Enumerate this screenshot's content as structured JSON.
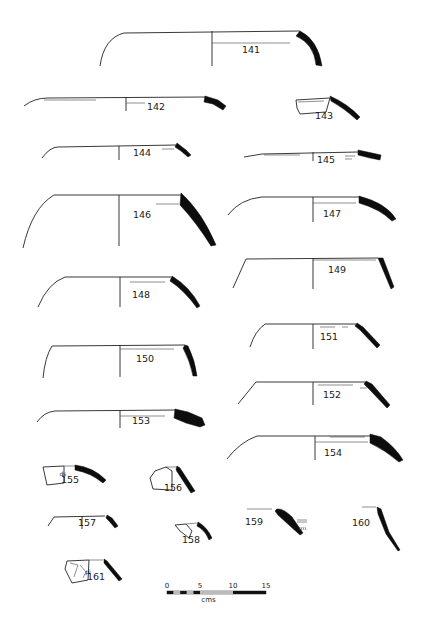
{
  "plate": {
    "background": "#ffffff",
    "ink_color": "#0d0d0d",
    "profiles": [
      {
        "id": "141",
        "label": "141",
        "label_xy": [
          251,
          53
        ],
        "outline": "M100,66 Q104,38 124,33 L300,31",
        "axis": "M212,31 L212,66",
        "inner": "M212,43 L290,43",
        "section": "M300,31 Q318,40 322,66 L316,65 Q314,44 296,36 Z"
      },
      {
        "id": "142",
        "label": "142",
        "label_xy": [
          156,
          110
        ],
        "outline": "M24,106 Q34,98 48,98 L205,97",
        "axis": "M126,97 L126,111",
        "inner": "M126,103 L145,103 M44,100 L96,100",
        "section": "M205,96 L218,100 L226,106 L223,110 L213,104 L204,102 Z"
      },
      {
        "id": "143",
        "label": "143",
        "label_xy": [
          324,
          119
        ],
        "outline": "M296,100 L330,98 L326,112 L300,114 L297,108 Z",
        "axis": "",
        "inner": "M298,102 L324,101",
        "section": "M330,96 Q348,104 360,117 L357,120 Q344,108 331,101 Z"
      },
      {
        "id": "144",
        "label": "144",
        "label_xy": [
          142,
          156
        ],
        "outline": "M42,158 Q50,147 58,147 L176,145",
        "axis": "M119,146 L119,160",
        "inner": "M162,149 L174,149",
        "section": "M177,143 L186,150 L191,155 L188,157 L181,151 L175,147 Z"
      },
      {
        "id": "145",
        "label": "145",
        "label_xy": [
          326,
          163
        ],
        "outline": "M244,157 L262,154 L358,152",
        "axis": "M313,152 L313,161",
        "inner": "M264,155 L300,155 M345,156 L355,156 M345,159 L352,159",
        "section": "M358,150 L372,153 L381,155 L380,160 L370,158 L358,155 Z"
      },
      {
        "id": "146",
        "label": "146",
        "label_xy": [
          142,
          218
        ],
        "outline": "M23,248 Q32,208 54,195 L181,195",
        "axis": "M119,195 L119,246",
        "inner": "M156,204 L179,204",
        "section": "M181,193 Q202,212 216,245 L211,246 Q196,222 180,205 Z"
      },
      {
        "id": "147",
        "label": "147",
        "label_xy": [
          332,
          217
        ],
        "outline": "M228,215 Q240,199 262,197 L359,197",
        "axis": "M313,197 L313,222",
        "inner": "M313,203 L356,203",
        "section": "M359,196 Q386,203 396,219 L392,221 Q380,209 359,203 Z"
      },
      {
        "id": "148",
        "label": "148",
        "label_xy": [
          141,
          298
        ],
        "outline": "M38,307 Q48,283 65,277 L171,277",
        "axis": "M120,277 L120,307",
        "inner": "M130,282 L165,282",
        "section": "M172,276 Q190,287 200,306 L197,308 Q184,290 170,281 Z"
      },
      {
        "id": "149",
        "label": "149",
        "label_xy": [
          337,
          273
        ],
        "outline": "M233,288 L246,259 L378,258",
        "axis": "M313,258 L313,289",
        "inner": "M313,260 L376,260",
        "section": "M378,258 L383,258 L394,287 L391,289 Z"
      },
      {
        "id": "150",
        "label": "150",
        "label_xy": [
          145,
          362
        ],
        "outline": "M43,378 Q45,357 52,346 L185,345",
        "axis": "M120,345 L120,377",
        "inner": "M120,349 L174,349",
        "section": "M185,345 L188,346 Q195,360 197,376 L193,376 Q190,361 183,348 Z"
      },
      {
        "id": "151",
        "label": "151",
        "label_xy": [
          329,
          340
        ],
        "outline": "M250,347 Q255,331 265,324 L356,324",
        "axis": "M313,324 L313,349",
        "inner": "M320,327 L335,327 M342,327 L348,327",
        "section": "M357,323 L363,327 L380,345 L377,348 L360,330 L355,326 Z"
      },
      {
        "id": "152",
        "label": "152",
        "label_xy": [
          332,
          398
        ],
        "outline": "M238,404 L256,382 L365,382",
        "axis": "M313,382 L313,405",
        "inner": "M318,385 L353,385 M360,388 L367,388",
        "section": "M366,381 L372,384 L390,405 L387,408 L369,389 L364,384 Z"
      },
      {
        "id": "153",
        "label": "153",
        "label_xy": [
          141,
          424
        ],
        "outline": "M37,422 Q44,412 55,411 L175,410",
        "axis": "M120,410 L120,428",
        "inner": "M120,416 L165,416",
        "section": "M175,409 L188,412 L202,418 L205,425 L200,427 L186,423 L174,418 Z"
      },
      {
        "id": "154",
        "label": "154",
        "label_xy": [
          333,
          456
        ],
        "outline": "M227,459 Q240,442 257,436 L370,436",
        "axis": "M315,436 L315,460",
        "inner": "M330,437 L365,437 M315,442 L368,442",
        "section": "M370,434 L381,437 Q396,448 403,460 L399,462 Q385,450 370,443 Z"
      }
    ],
    "fragments": [
      {
        "id": "155",
        "label": "155",
        "label_xy": [
          70,
          483
        ],
        "note": "ds",
        "note_xy": [
          63,
          476
        ],
        "outline": "M43,467 L64,466 L64,483 L47,485 Z",
        "extra": "M64,466 L75,466",
        "section": "M75,465 Q93,467 106,480 L103,483 Q91,473 75,470 Z"
      },
      {
        "id": "156",
        "label": "156",
        "label_xy": [
          173,
          491
        ],
        "outline": "M155,471 L166,467 L172,471 L172,490 L153,489 L150,478 Z",
        "extra": "M166,467 L177,467",
        "section": "M177,466 L180,468 L195,491 L191,493 L176,470 Z"
      },
      {
        "id": "157",
        "label": "157",
        "label_xy": [
          87,
          526
        ],
        "outline": "M48,526 L54,517 L105,516",
        "axis": "M82,516 L82,529",
        "inner": "",
        "section": "M107,515 L112,518 L118,526 L115,528 L109,521 L106,518 Z"
      },
      {
        "id": "158",
        "label": "158",
        "label_xy": [
          191,
          543
        ],
        "outline": "M175,525 L186,524 L192,531 L189,538 L180,531 Z",
        "extra": "M186,524 L197,523",
        "section": "M198,522 Q207,527 212,538 L209,540 Q205,530 197,526 Z"
      },
      {
        "id": "159",
        "label": "159",
        "label_xy": [
          254,
          525
        ],
        "outline": "",
        "extra": "M247,509 L272,509",
        "note": "incised",
        "note_xy": [
          298,
          519
        ],
        "section": "M277,509 Q283,508 292,517 L303,533 L300,535 L290,526 L278,515 L275,511 Z"
      },
      {
        "id": "160",
        "label": "160",
        "label_xy": [
          361,
          526
        ],
        "outline": "",
        "extra": "M362,507 L376,507",
        "section": "M377,507 L381,509 L389,532 L400,550 L398,551 L386,534 L378,514 Z"
      },
      {
        "id": "161",
        "label": "161",
        "label_xy": [
          96,
          580
        ],
        "outline": "M67,561 L89,560 L88,580 L72,583 L65,569 Z",
        "extra": "M89,560 L103,560 M70,563 L78,565 L74,577 M80,565 L86,572 L83,578",
        "note": "pi",
        "note_xy": [
          88,
          574
        ],
        "section": "M104,559 L107,561 L122,579 L119,581 L104,563 Z"
      }
    ],
    "scale_bar": {
      "ticks": [
        "0",
        "5",
        "10",
        "15"
      ],
      "unit": "cms",
      "x0": 167,
      "x15": 266,
      "y": 591
    }
  }
}
